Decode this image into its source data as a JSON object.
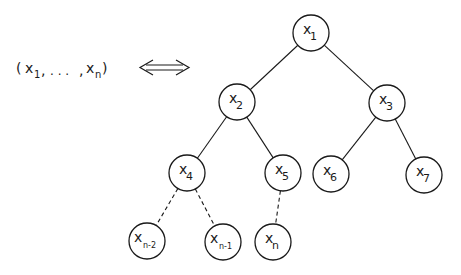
{
  "sequence": {
    "open": "(",
    "first_var": "x",
    "first_sub": "1",
    "sep1": ",",
    "ellipsis": ". . .",
    "sep2": ",",
    "last_var": "x",
    "last_sub": "n",
    "close": ")"
  },
  "arrow": {
    "type": "double-arrow"
  },
  "tree": {
    "nodes": [
      {
        "id": "x1",
        "var": "x",
        "sub": "1",
        "cx": 311,
        "cy": 33
      },
      {
        "id": "x2",
        "var": "x",
        "sub": "2",
        "cx": 237,
        "cy": 102
      },
      {
        "id": "x3",
        "var": "x",
        "sub": "3",
        "cx": 387,
        "cy": 103
      },
      {
        "id": "x4",
        "var": "x",
        "sub": "4",
        "cx": 187,
        "cy": 173
      },
      {
        "id": "x5",
        "var": "x",
        "sub": "5",
        "cx": 283,
        "cy": 173
      },
      {
        "id": "x6",
        "var": "x",
        "sub": "6",
        "cx": 331,
        "cy": 174
      },
      {
        "id": "x7",
        "var": "x",
        "sub": "7",
        "cx": 424,
        "cy": 175
      },
      {
        "id": "xn-2",
        "var": "x",
        "sub": "n-2",
        "cx": 147,
        "cy": 241
      },
      {
        "id": "xn-1",
        "var": "x",
        "sub": "n-1",
        "cx": 223,
        "cy": 242
      },
      {
        "id": "xn",
        "var": "x",
        "sub": "n",
        "cx": 273,
        "cy": 242
      }
    ],
    "edges": [
      {
        "from": "x1",
        "to": "x2",
        "style": "solid"
      },
      {
        "from": "x1",
        "to": "x3",
        "style": "solid"
      },
      {
        "from": "x2",
        "to": "x4",
        "style": "solid"
      },
      {
        "from": "x2",
        "to": "x5",
        "style": "solid"
      },
      {
        "from": "x3",
        "to": "x6",
        "style": "solid"
      },
      {
        "from": "x3",
        "to": "x7",
        "style": "solid"
      },
      {
        "from": "x4",
        "to": "xn-2",
        "style": "dashed"
      },
      {
        "from": "x4",
        "to": "xn-1",
        "style": "dashed"
      },
      {
        "from": "x5",
        "to": "xn",
        "style": "dashed"
      }
    ],
    "radius": 18
  }
}
